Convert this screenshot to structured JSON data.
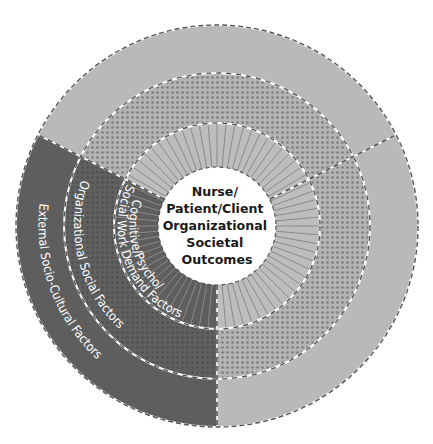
{
  "diagram": {
    "type": "concentric-ring-model",
    "center": {
      "lines": [
        "Nurse/",
        "Patient/Client",
        "Organizational",
        "Societal",
        "Outcomes"
      ]
    },
    "rings": [
      {
        "id": "inner",
        "label": "Cognitive/Psycho/",
        "label_line2": "Social Work Demand Factors",
        "pattern": "radial-stripes"
      },
      {
        "id": "middle",
        "label": "Organizational Social Factors",
        "pattern": "dots"
      },
      {
        "id": "outer",
        "label": "External Socio-Cultural Factors",
        "pattern": "solid"
      }
    ],
    "segments": [
      {
        "id": "top",
        "shade": "light",
        "from_deg": 207,
        "to_deg": 333
      },
      {
        "id": "lower-right",
        "shade": "light",
        "from_deg": -27,
        "to_deg": 90
      },
      {
        "id": "lower-left",
        "shade": "dark",
        "from_deg": 90,
        "to_deg": 207,
        "labeled": true
      }
    ],
    "colors": {
      "light_outer": "#b9b9b9",
      "light_dots_bg": "#b4b4b4",
      "dots": "#7a7a7a",
      "light_stripes_bg": "#bdbdbd",
      "stripes": "#8a8a8a",
      "dark": "#5e5e5e",
      "dark_dots": "#4c4c4c",
      "center_fill": "#ffffff",
      "divider": "#555555"
    }
  }
}
